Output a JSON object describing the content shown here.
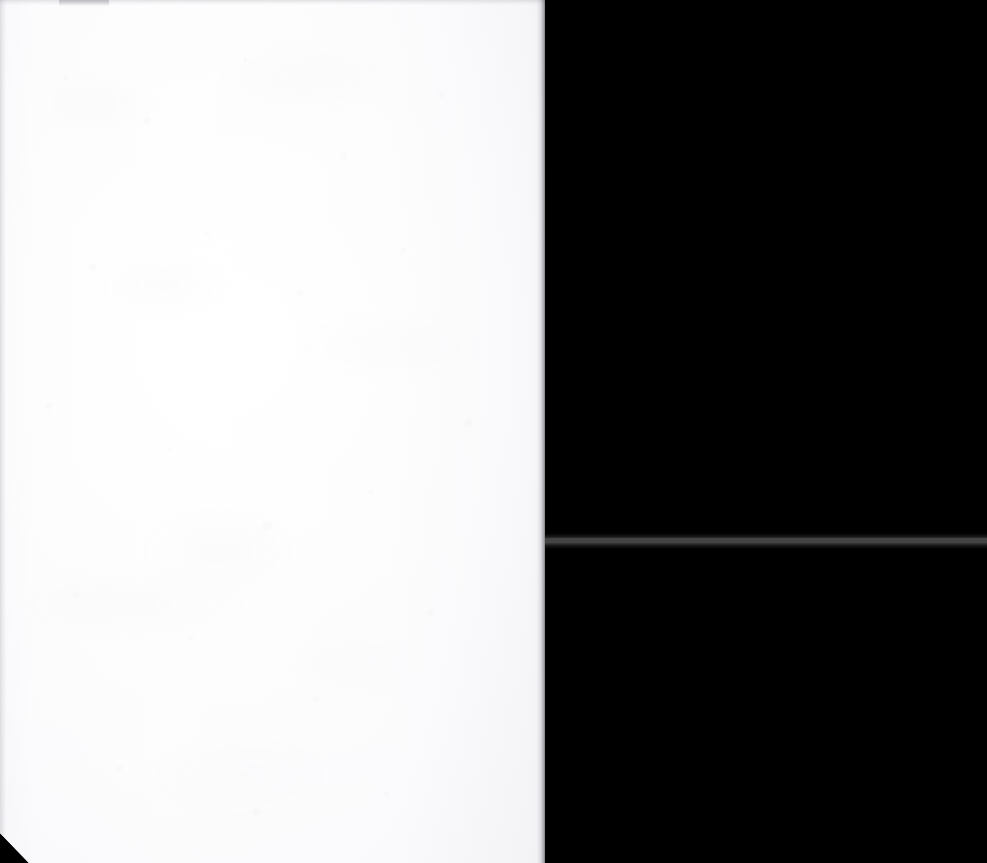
{
  "document": {
    "kind": "scanned-page",
    "description": "Blank white paper sheet photographed against a black background",
    "page_text": "",
    "visible_text_content": [],
    "canvas": {
      "width": 987,
      "height": 863
    }
  },
  "colors": {
    "background": "#000000",
    "paper": "#fdfdfe",
    "paper_edge_shadow": "#50505a",
    "seam_line": "#444444",
    "top_smudge": "#9a9aa2"
  },
  "sheet": {
    "name": "paper-sheet",
    "left": 0,
    "top": 0,
    "width": 545,
    "height": 863,
    "cut_corner": "bottom-left",
    "cut_corner_x": 29,
    "cut_corner_y": 833
  },
  "artifacts": {
    "seam_line": {
      "name": "horizontal-seam-line",
      "left": 541,
      "top": 538,
      "width": 446,
      "height": 5
    },
    "top_smudge": {
      "name": "top-edge-smudge",
      "left": 59,
      "top": 0,
      "width": 50,
      "height": 7
    }
  }
}
